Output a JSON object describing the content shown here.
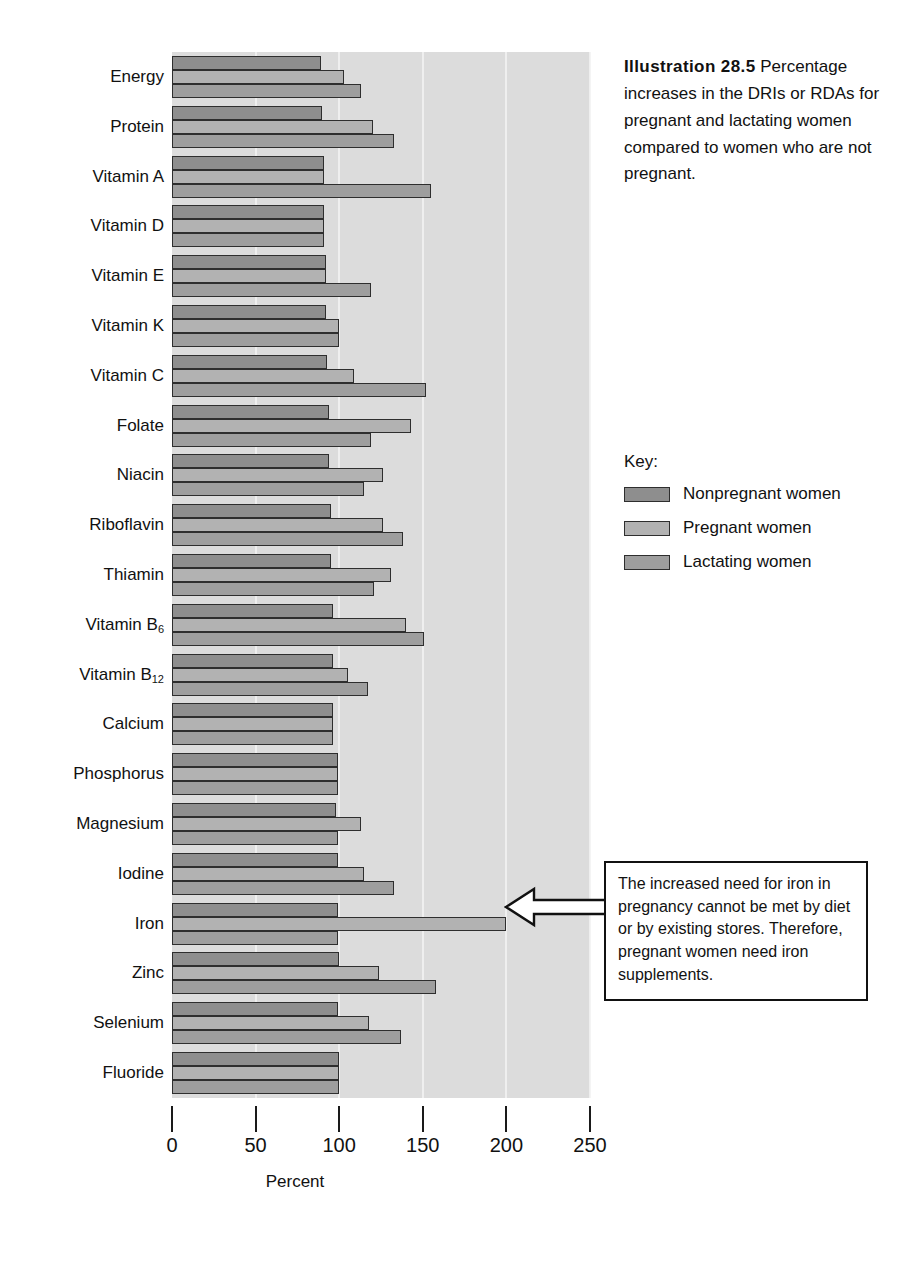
{
  "caption": {
    "title": "Illustration 28.5",
    "body": "Percentage increases in the DRIs or RDAs for pregnant and lactating women compared to women who are not pregnant."
  },
  "legend": {
    "title": "Key:",
    "items": [
      {
        "label": "Nonpregnant women",
        "color": "#8e8e8e"
      },
      {
        "label": "Pregnant women",
        "color": "#b2b2b2"
      },
      {
        "label": "Lactating women",
        "color": "#9e9e9e"
      }
    ]
  },
  "callout": {
    "text": "The increased need for iron in pregnancy cannot be met by diet or by existing stores.  Therefore, pregnant women need iron supplements.",
    "points_to": "Iron pregnant bar"
  },
  "chart_data": {
    "type": "bar",
    "orientation": "horizontal",
    "title": "Illustration 28.5",
    "xlabel": "Percent",
    "ylabel": "",
    "xlim": [
      0,
      250
    ],
    "xticks": [
      0,
      50,
      100,
      150,
      200,
      250
    ],
    "grid": true,
    "legend_position": "right",
    "categories": [
      "Energy",
      "Protein",
      "Vitamin A",
      "Vitamin D",
      "Vitamin E",
      "Vitamin K",
      "Vitamin C",
      "Folate",
      "Niacin",
      "Riboflavin",
      "Thiamin",
      "Vitamin B6",
      "Vitamin B12",
      "Calcium",
      "Phosphorus",
      "Magnesium",
      "Iodine",
      "Iron",
      "Zinc",
      "Selenium",
      "Fluoride"
    ],
    "category_labels_html": [
      "Energy",
      "Protein",
      "Vitamin A",
      "Vitamin D",
      "Vitamin E",
      "Vitamin K",
      "Vitamin C",
      "Folate",
      "Niacin",
      "Riboflavin",
      "Thiamin",
      "Vitamin B<sub>6</sub>",
      "Vitamin B<sub>12</sub>",
      "Calcium",
      "Phosphorus",
      "Magnesium",
      "Iodine",
      "Iron",
      "Zinc",
      "Selenium",
      "Fluoride"
    ],
    "series": [
      {
        "name": "Nonpregnant women",
        "color": "#8e8e8e",
        "values": [
          89,
          90,
          91,
          91,
          92,
          92,
          93,
          94,
          94,
          95,
          95,
          96,
          96,
          96,
          99,
          98,
          99,
          99,
          100,
          99,
          100
        ]
      },
      {
        "name": "Pregnant women",
        "color": "#b2b2b2",
        "values": [
          103,
          120,
          91,
          91,
          92,
          100,
          109,
          143,
          126,
          126,
          131,
          140,
          105,
          96,
          99,
          113,
          115,
          200,
          124,
          118,
          100
        ]
      },
      {
        "name": "Lactating women",
        "color": "#9e9e9e",
        "values": [
          113,
          133,
          155,
          91,
          119,
          100,
          152,
          119,
          115,
          138,
          121,
          151,
          117,
          96,
          99,
          99,
          133,
          99,
          158,
          137,
          100
        ]
      }
    ]
  }
}
